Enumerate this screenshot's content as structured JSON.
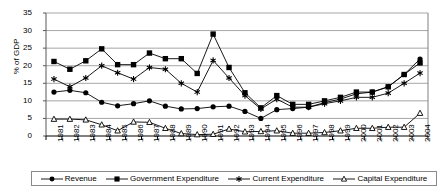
{
  "chart_data": {
    "type": "line",
    "title": "",
    "subtitle": "",
    "xlabel": "",
    "ylabel": "% of GDP",
    "ylim": [
      0,
      35
    ],
    "ytick_step": 5,
    "yticks": [
      0,
      5,
      10,
      15,
      20,
      25,
      30,
      35
    ],
    "grid": true,
    "grid_axis": "y",
    "legend_position": "bottom",
    "categories": [
      "1981",
      "1982",
      "1983",
      "1984",
      "1985",
      "1986",
      "1987",
      "1988",
      "1989",
      "1990",
      "1991",
      "1992",
      "1993",
      "1994",
      "1995",
      "1996",
      "1997",
      "1998",
      "1999",
      "2000",
      "2001",
      "2002",
      "2003",
      "2004"
    ],
    "series": [
      {
        "name": "Revenue",
        "marker": "filled-circle",
        "values": [
          12.5,
          13.0,
          12.3,
          9.6,
          8.6,
          9.2,
          10.0,
          8.5,
          7.7,
          7.8,
          8.3,
          8.5,
          7.0,
          5.0,
          7.5,
          7.8,
          8.2,
          9.5,
          10.5,
          12.0,
          12.5,
          14.0,
          17.5,
          21.9
        ]
      },
      {
        "name": "Government Expenditure",
        "marker": "filled-square",
        "values": [
          21.2,
          19.0,
          21.4,
          24.8,
          20.3,
          20.3,
          23.6,
          22.0,
          22.0,
          17.8,
          29.0,
          19.5,
          12.3,
          8.0,
          11.5,
          9.0,
          9.0,
          10.0,
          11.0,
          12.5,
          12.5,
          14.0,
          17.5,
          20.8
        ]
      },
      {
        "name": "Current Expenditure",
        "marker": "asterisk",
        "values": [
          16.2,
          14.0,
          16.5,
          20.0,
          18.0,
          16.2,
          19.5,
          19.0,
          15.0,
          12.5,
          21.5,
          16.5,
          11.5,
          7.7,
          10.5,
          8.2,
          8.2,
          9.2,
          10.0,
          11.0,
          11.0,
          12.2,
          15.0,
          17.9
        ]
      },
      {
        "name": "Capital Expenditure",
        "marker": "open-triangle",
        "values": [
          4.8,
          4.8,
          4.6,
          3.2,
          1.5,
          4.0,
          3.9,
          2.2,
          0.7,
          0.4,
          0.5,
          2.0,
          1.2,
          1.3,
          1.5,
          0.8,
          0.8,
          1.0,
          1.5,
          2.2,
          2.2,
          2.5,
          2.5,
          6.5
        ]
      }
    ],
    "colors": {
      "line": "#000000",
      "grid": "#a6a6a6",
      "axis": "#808080",
      "background": "#ffffff"
    }
  },
  "legend": {
    "entries": [
      {
        "label": "Revenue",
        "marker": "filled-circle"
      },
      {
        "label": "Government Expenditure",
        "marker": "filled-square"
      },
      {
        "label": "Current Expenditure",
        "marker": "asterisk"
      },
      {
        "label": "Capital Expenditure",
        "marker": "open-triangle"
      }
    ]
  }
}
